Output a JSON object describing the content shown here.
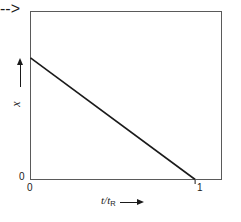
{
  "chart_data": {
    "type": "line",
    "title": "",
    "subtitle": "",
    "xlabel": "t/t_R",
    "ylabel": "x",
    "xlabel_parts": {
      "numerator": "t",
      "separator": "/",
      "denominator": "t",
      "denominator_subscript": "R"
    },
    "ylabel_parts": {
      "variable": "x"
    },
    "xlim": [
      0,
      1.16
    ],
    "ylim": [
      0,
      1.16
    ],
    "x_ticks": [
      "0",
      "1"
    ],
    "x_tick_values": [
      0,
      1
    ],
    "y_ticks": [
      "0"
    ],
    "y_tick_values": [
      0
    ],
    "grid": false,
    "legend": false,
    "legend_position": "none",
    "frame": true,
    "series": [
      {
        "name": "conversion-decay",
        "x": [
          0,
          1
        ],
        "values": [
          0.84,
          0.0
        ],
        "color": "#1a1a1a",
        "linewidth": 1.6
      }
    ],
    "annotations": [
      {
        "name": "x-axis-arrow",
        "type": "arrow",
        "direction": "right"
      },
      {
        "name": "y-axis-arrow",
        "type": "arrow",
        "direction": "up"
      }
    ],
    "colors": {
      "background": "#ffffff",
      "frame": "#5a5a5a",
      "line": "#1a1a1a",
      "text": "#1a1a1a"
    }
  },
  "axes": {
    "x": {
      "tick_0": "0",
      "tick_1": "1",
      "title_numerator": "t",
      "title_slash": "/",
      "title_denominator": "t",
      "title_subscript": "R"
    },
    "y": {
      "tick_0": "0",
      "title": "x"
    }
  }
}
